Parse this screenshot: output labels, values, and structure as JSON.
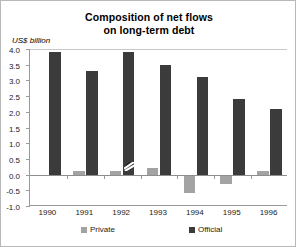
{
  "chart_data": {
    "type": "bar",
    "title": "Composition of net flows on long-term debt",
    "title_lines": [
      "Composition of net flows",
      "on long-term debt"
    ],
    "xlabel": "",
    "ylabel": "US$ billion",
    "categories": [
      "1990",
      "1991",
      "1992",
      "1993",
      "1994",
      "1995",
      "1996"
    ],
    "series": [
      {
        "name": "Private",
        "color": "#a3a3a3",
        "values": [
          -0.05,
          0.1,
          0.1,
          0.2,
          -0.6,
          -0.3,
          0.1
        ]
      },
      {
        "name": "Official",
        "color": "#3b3b3b",
        "values": [
          3.9,
          3.3,
          3.9,
          3.5,
          3.1,
          2.4,
          2.1
        ]
      }
    ],
    "ylim": [
      -1.0,
      4.0
    ],
    "ytick_values": [
      4.0,
      3.5,
      3.0,
      2.5,
      2.0,
      1.5,
      1.0,
      0.5,
      0.0,
      -0.5,
      -1.0
    ],
    "ytick_labels": [
      "4.0",
      "3.5",
      "3.0",
      "2.5",
      "2.0",
      "1.5",
      "1.0",
      "0.5",
      "0.0",
      "-0.5",
      "-1.0"
    ],
    "grid": "top-line-only",
    "legend_position": "bottom",
    "annotations": [
      "scan-artifact over 1992 Official bar near 0.25"
    ]
  },
  "legend": {
    "private_label": "Private",
    "official_label": "Official"
  },
  "colors": {
    "private": "#a3a3a3",
    "official": "#3b3b3b",
    "axis": "#9a9a9a",
    "frame": "#b8b8b8",
    "text": "#000000"
  }
}
